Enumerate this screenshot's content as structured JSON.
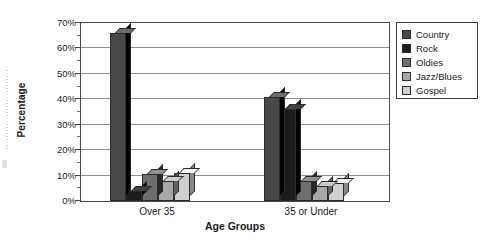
{
  "chart_data": {
    "type": "bar",
    "title": "",
    "xlabel": "Age Groups",
    "ylabel": "Percentage",
    "categories": [
      "Over 35",
      "35 or Under"
    ],
    "ylim": [
      0,
      70
    ],
    "yticks": [
      0,
      10,
      20,
      30,
      40,
      50,
      60,
      70
    ],
    "ytick_labels": [
      "0%",
      "10%",
      "20%",
      "30%",
      "40%",
      "50%",
      "60%",
      "70%"
    ],
    "minor_tick_interval": 5,
    "grid": true,
    "grid_axis": "y",
    "legend_position": "right",
    "value_unit": "%",
    "series": [
      {
        "name": "Country",
        "color": "#484848",
        "values": [
          66,
          41
        ]
      },
      {
        "name": "Rock",
        "color": "#1c1c1c",
        "values": [
          4,
          36
        ]
      },
      {
        "name": "Oldies",
        "color": "#6e6e6e",
        "values": [
          10.5,
          8
        ]
      },
      {
        "name": "Jazz/Blues",
        "color": "#a8a8a8",
        "values": [
          8,
          6
        ]
      },
      {
        "name": "Gospel",
        "color": "#d0d0d0",
        "values": [
          11,
          7
        ]
      }
    ]
  },
  "axis": {
    "y_title": "Percentage",
    "x_title": "Age Groups"
  }
}
